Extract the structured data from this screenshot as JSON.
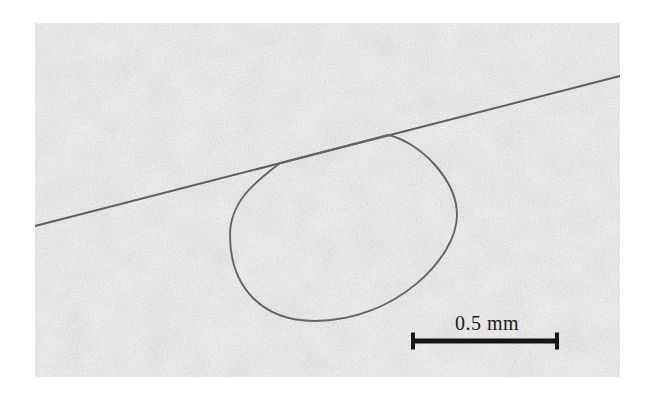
{
  "figure": {
    "kind": "optical-micrograph",
    "scale_bar": {
      "label": "0.5 mm"
    },
    "colors": {
      "page_background": "#ffffff",
      "photo_base": "#cbcbcb",
      "fiber": "#5e5e5e",
      "scale_bar": "#161616",
      "label_text": "#1b1b1b"
    }
  }
}
